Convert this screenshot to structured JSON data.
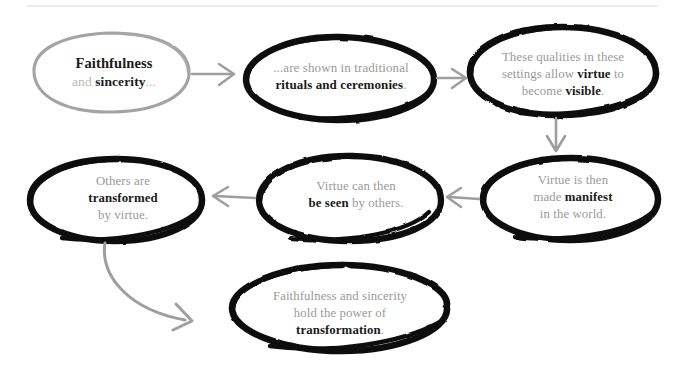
{
  "diagram": {
    "type": "flowchart",
    "colors": {
      "ink_dark": "#111111",
      "ink_gray": "#9a9a9a",
      "text_gray": "#9a9a9a",
      "text_dark": "#1a1a1a",
      "arrow_gray": "#9e9e9e",
      "rule_gray": "#d9d9d9",
      "background": "#ffffff"
    },
    "top_rule": true,
    "nodes": [
      {
        "id": "node1",
        "outline": "gray",
        "lines": [
          {
            "segments": [
              {
                "text": "Faithfulness",
                "style": "bold-large"
              }
            ]
          },
          {
            "segments": [
              {
                "text": "and ",
                "style": "dim"
              },
              {
                "text": "sincerity",
                "style": "bold"
              },
              {
                "text": "...",
                "style": "dim"
              }
            ]
          }
        ],
        "plain_text": "Faithfulness and sincerity..."
      },
      {
        "id": "node2",
        "outline": "dark",
        "lines": [
          {
            "segments": [
              {
                "text": "...are shown in traditional",
                "style": "normal"
              }
            ]
          },
          {
            "segments": [
              {
                "text": "rituals and ceremonies",
                "style": "bold"
              },
              {
                "text": ".",
                "style": "normal"
              }
            ]
          }
        ],
        "plain_text": "...are shown in traditional rituals and ceremonies."
      },
      {
        "id": "node3",
        "outline": "dark",
        "lines": [
          {
            "segments": [
              {
                "text": "These qualities in these",
                "style": "normal"
              }
            ]
          },
          {
            "segments": [
              {
                "text": "settings allow ",
                "style": "normal"
              },
              {
                "text": "virtue",
                "style": "bold"
              },
              {
                "text": " to",
                "style": "normal"
              }
            ]
          },
          {
            "segments": [
              {
                "text": "become ",
                "style": "normal"
              },
              {
                "text": "visible",
                "style": "bold"
              },
              {
                "text": ".",
                "style": "normal"
              }
            ]
          }
        ],
        "plain_text": "These qualities in these settings allow virtue to become visible."
      },
      {
        "id": "node4",
        "outline": "dark",
        "lines": [
          {
            "segments": [
              {
                "text": "Virtue is then",
                "style": "normal"
              }
            ]
          },
          {
            "segments": [
              {
                "text": "made ",
                "style": "normal"
              },
              {
                "text": "manifest",
                "style": "bold"
              }
            ]
          },
          {
            "segments": [
              {
                "text": "in the world.",
                "style": "normal"
              }
            ]
          }
        ],
        "plain_text": "Virtue is then made manifest in the world."
      },
      {
        "id": "node5",
        "outline": "dark",
        "lines": [
          {
            "segments": [
              {
                "text": "Virtue can then",
                "style": "normal"
              }
            ]
          },
          {
            "segments": [
              {
                "text": "be seen",
                "style": "bold"
              },
              {
                "text": " by others.",
                "style": "normal"
              }
            ]
          }
        ],
        "plain_text": "Virtue can then be seen by others."
      },
      {
        "id": "node6",
        "outline": "dark",
        "lines": [
          {
            "segments": [
              {
                "text": "Others are",
                "style": "normal"
              }
            ]
          },
          {
            "segments": [
              {
                "text": "transformed",
                "style": "bold"
              }
            ]
          },
          {
            "segments": [
              {
                "text": "by virtue.",
                "style": "normal"
              }
            ]
          }
        ],
        "plain_text": "Others are transformed by virtue."
      },
      {
        "id": "node7",
        "outline": "dark",
        "lines": [
          {
            "segments": [
              {
                "text": "Faithfulness and sincerity",
                "style": "normal"
              }
            ]
          },
          {
            "segments": [
              {
                "text": "hold the power of",
                "style": "normal"
              }
            ]
          },
          {
            "segments": [
              {
                "text": "transformation",
                "style": "bold"
              },
              {
                "text": ".",
                "style": "normal"
              }
            ]
          }
        ],
        "plain_text": "Faithfulness and sincerity hold the power of transformation."
      }
    ],
    "arrows": [
      {
        "id": "arrow-1-2",
        "from": "node1",
        "to": "node2",
        "direction": "right"
      },
      {
        "id": "arrow-2-3",
        "from": "node2",
        "to": "node3",
        "direction": "right"
      },
      {
        "id": "arrow-3-4",
        "from": "node3",
        "to": "node4",
        "direction": "down"
      },
      {
        "id": "arrow-4-5",
        "from": "node4",
        "to": "node5",
        "direction": "left"
      },
      {
        "id": "arrow-5-6",
        "from": "node5",
        "to": "node6",
        "direction": "left"
      },
      {
        "id": "arrow-6-7",
        "from": "node6",
        "to": "node7",
        "direction": "curve-down-right"
      }
    ]
  }
}
